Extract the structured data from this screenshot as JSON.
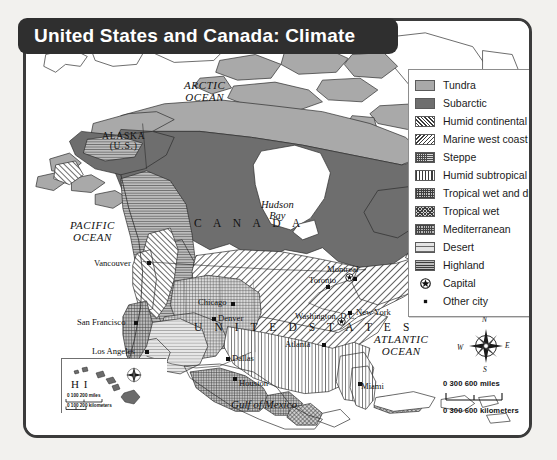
{
  "figure": {
    "title": "United States and Canada: Climate",
    "type": "thematic-climate-map"
  },
  "legend": {
    "items": [
      {
        "label": "Tundra",
        "swatch": "tundra",
        "kind": "area"
      },
      {
        "label": "Subarctic",
        "swatch": "subarctic",
        "kind": "area"
      },
      {
        "label": "Humid continental",
        "swatch": "humidcont",
        "kind": "area"
      },
      {
        "label": "Marine west coast",
        "swatch": "marine",
        "kind": "area"
      },
      {
        "label": "Steppe",
        "swatch": "steppe",
        "kind": "area"
      },
      {
        "label": "Humid subtropical",
        "swatch": "humidsub",
        "kind": "area"
      },
      {
        "label": "Tropical wet and dry",
        "swatch": "tropwetdry",
        "kind": "area"
      },
      {
        "label": "Tropical wet",
        "swatch": "tropwet",
        "kind": "area"
      },
      {
        "label": "Mediterranean",
        "swatch": "medit",
        "kind": "area"
      },
      {
        "label": "Desert",
        "swatch": "desert",
        "kind": "area"
      },
      {
        "label": "Highland",
        "swatch": "highland",
        "kind": "area"
      },
      {
        "label": "Capital",
        "swatch": "capital-star-icon",
        "kind": "symbol"
      },
      {
        "label": "Other city",
        "swatch": "city-dot-icon",
        "kind": "symbol"
      }
    ]
  },
  "labels": {
    "oceans": [
      {
        "name": "arctic-ocean",
        "line1": "ARCTIC",
        "line2": "OCEAN"
      },
      {
        "name": "pacific-ocean",
        "line1": "PACIFIC",
        "line2": "OCEAN"
      },
      {
        "name": "atlantic-ocean",
        "line1": "ATLANTIC",
        "line2": "OCEAN"
      }
    ],
    "countries": [
      {
        "name": "canada",
        "text": "C A N A D A"
      },
      {
        "name": "united-states",
        "text": "U N I T E D   S T A T E S"
      }
    ],
    "regions": [
      {
        "name": "alaska",
        "line1": "ALASKA",
        "line2": "(U.S.)"
      },
      {
        "name": "hudson-bay",
        "line1": "Hudson",
        "line2": "Bay"
      },
      {
        "name": "gulf-of-mexico",
        "line1": "Gulf of Mexico",
        "line2": ""
      }
    ]
  },
  "cities": [
    {
      "name": "vancouver",
      "label": "Vancouver",
      "capital": false
    },
    {
      "name": "san-francisco",
      "label": "San Francisco",
      "capital": false
    },
    {
      "name": "los-angeles",
      "label": "Los Angeles",
      "capital": false
    },
    {
      "name": "denver",
      "label": "Denver",
      "capital": false
    },
    {
      "name": "dallas",
      "label": "Dallas",
      "capital": false
    },
    {
      "name": "houston",
      "label": "Houston",
      "capital": false
    },
    {
      "name": "chicago",
      "label": "Chicago",
      "capital": false
    },
    {
      "name": "atlanta",
      "label": "Atlanta",
      "capital": false
    },
    {
      "name": "miami",
      "label": "Miami",
      "capital": false
    },
    {
      "name": "new-york",
      "label": "New York",
      "capital": false
    },
    {
      "name": "toronto",
      "label": "Toronto",
      "capital": false
    },
    {
      "name": "montreal",
      "label": "Montreal",
      "capital": false
    },
    {
      "name": "washington-dc",
      "label": "Washington, D.C.",
      "capital": true
    },
    {
      "name": "ottawa",
      "label": "",
      "capital": true
    }
  ],
  "compass": {
    "north": "N",
    "east": "E",
    "south": "S",
    "west": "W"
  },
  "scale_main": {
    "miles": "0        300       600 miles",
    "kilometers": "0   300 600 kilometers",
    "miles_ticks": [
      "0",
      "300",
      "600 miles"
    ],
    "km_ticks": [
      "0",
      "300",
      "600 kilometers"
    ]
  },
  "inset": {
    "name": "hawaii-inset",
    "label": "H I",
    "scale_miles": "0      100    200 miles",
    "scale_kilometers": "0  100 200 kilometers"
  },
  "colors": {
    "frame": "#3b3b3b",
    "banner": "#2f2f2f",
    "banner_text": "#ffffff",
    "tundra": "#a9a9a9",
    "subarctic": "#6e6e6e",
    "page_background": "#f2f1ee",
    "map_background": "#ffffff"
  }
}
